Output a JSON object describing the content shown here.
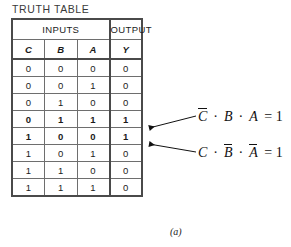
{
  "title": "TRUTH TABLE",
  "caption": "(a)",
  "table": {
    "group_headers": [
      {
        "label": "INPUTS",
        "span": 3
      },
      {
        "label": "OUTPUT",
        "span": 1
      }
    ],
    "columns": [
      "C",
      "B",
      "A",
      "Y"
    ],
    "rows": [
      {
        "c": "0",
        "b": "0",
        "a": "0",
        "y": "0",
        "highlight": false
      },
      {
        "c": "0",
        "b": "0",
        "a": "1",
        "y": "0",
        "highlight": false
      },
      {
        "c": "0",
        "b": "1",
        "a": "0",
        "y": "0",
        "highlight": false
      },
      {
        "c": "0",
        "b": "1",
        "a": "1",
        "y": "1",
        "highlight": true
      },
      {
        "c": "1",
        "b": "0",
        "a": "0",
        "y": "1",
        "highlight": true
      },
      {
        "c": "1",
        "b": "0",
        "a": "1",
        "y": "0",
        "highlight": false
      },
      {
        "c": "1",
        "b": "1",
        "a": "0",
        "y": "0",
        "highlight": false
      },
      {
        "c": "1",
        "b": "1",
        "a": "1",
        "y": "0",
        "highlight": false
      }
    ]
  },
  "annotations": [
    {
      "id": "minterm-1",
      "terms": [
        {
          "var": "C",
          "bar": true
        },
        {
          "var": "B",
          "bar": false
        },
        {
          "var": "A",
          "bar": false
        }
      ],
      "operator": "·",
      "equals": "= 1",
      "text": "C̄ · B · A = 1",
      "target_row": 4
    },
    {
      "id": "minterm-2",
      "terms": [
        {
          "var": "C",
          "bar": false
        },
        {
          "var": "B",
          "bar": true
        },
        {
          "var": "A",
          "bar": true
        }
      ],
      "operator": "·",
      "equals": "= 1",
      "text": "C · B̄ · Ā = 1",
      "target_row": 5
    }
  ],
  "colors": {
    "background": "#ffffff",
    "text": "#1b1b1b",
    "grid_line": "#6e6e6e",
    "frame_line": "#4a4a4a",
    "title": "#3a3a3a"
  }
}
